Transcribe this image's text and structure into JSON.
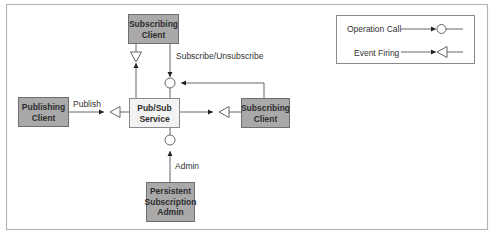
{
  "diagram": {
    "nodes": {
      "pubsub_service": {
        "line1": "Pub/Sub",
        "line2": "Service"
      },
      "subscribing_client_top": {
        "line1": "Subscribing",
        "line2": "Client"
      },
      "subscribing_client_right": {
        "line1": "Subscribing",
        "line2": "Client"
      },
      "publishing_client": {
        "line1": "Publishing",
        "line2": "Client"
      },
      "persistent_admin": {
        "line1": "Persistent",
        "line2": "Subscription",
        "line3": "Admin"
      }
    },
    "edge_labels": {
      "subscribe": "Subscribe/Unsubscribe",
      "publish": "Publish",
      "admin": "Admin"
    },
    "legend": {
      "operation_call": "Operation Call",
      "event_firing": "Event Firing"
    },
    "colors": {
      "client_fill": "#a9a9a9",
      "service_fill": "#f3f3f3",
      "line": "#555555",
      "frame": "#b0b0b0"
    }
  }
}
